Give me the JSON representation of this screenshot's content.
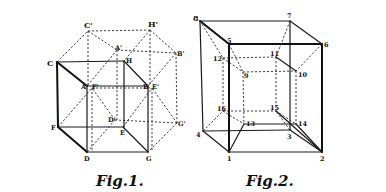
{
  "figures": [
    {
      "id": "fig1",
      "caption": "Fig.1.",
      "labels": {
        "C_prime": "C'",
        "H_prime": "H'",
        "A_prime": "A'",
        "B_prime": "B'",
        "C": "C",
        "H": "H",
        "A": "A",
        "F_prime": "F'",
        "B": "B",
        "E_prime": "E'",
        "D_prime": "D'",
        "G_prime": "G'",
        "F": "F",
        "E": "E",
        "D": "D",
        "G": "G"
      }
    },
    {
      "id": "fig2",
      "caption": "Fig.2.",
      "labels": {
        "v1": "1",
        "v2": "2",
        "v3": "3",
        "v4": "4",
        "v5": "5",
        "v6": "6",
        "v7": "7",
        "v8": "8",
        "v9": "9",
        "v10": "10",
        "v11": "11",
        "v12": "12",
        "v13": "13",
        "v14": "14",
        "v15": "15",
        "v16": "16"
      }
    }
  ],
  "colors": {
    "ink": "#111111",
    "paper": "#ffffff"
  }
}
